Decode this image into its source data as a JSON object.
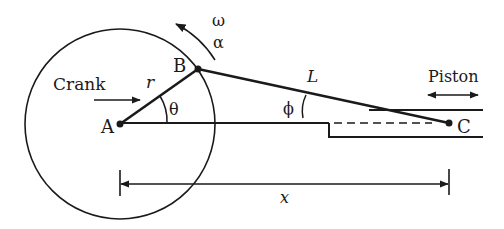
{
  "diagram": {
    "labels": {
      "crank": "Crank",
      "piston": "Piston",
      "point_a": "A",
      "point_b": "B",
      "point_c": "C",
      "crank_length": "r",
      "rod_length": "L",
      "crank_angle": "θ",
      "rod_angle": "ϕ",
      "angular_velocity": "ω",
      "angular_acceleration": "α",
      "displacement": "x"
    },
    "colors": {
      "ink": "#1a1a1a",
      "background": "#ffffff"
    }
  }
}
